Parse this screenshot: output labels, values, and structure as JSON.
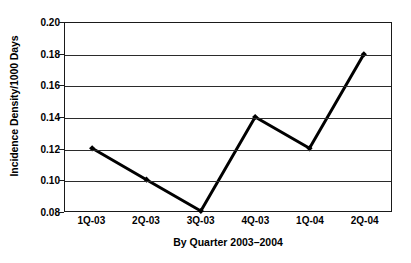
{
  "chart_data": {
    "type": "line",
    "title": "",
    "xlabel": "By Quarter 2003–2004",
    "ylabel": "Incidence Density/1000 Days",
    "categories": [
      "1Q-03",
      "2Q-03",
      "3Q-03",
      "4Q-03",
      "1Q-04",
      "2Q-04"
    ],
    "values": [
      0.12,
      0.1,
      0.08,
      0.14,
      0.12,
      0.18
    ],
    "ylim": [
      0.08,
      0.2
    ],
    "ytick_labels": [
      "0.20",
      "0.18",
      "0.16",
      "0.14",
      "0.12",
      "0.10",
      "0.08"
    ],
    "ytick_values": [
      0.2,
      0.18,
      0.16,
      0.14,
      0.12,
      0.1,
      0.08
    ],
    "ytick_step": 0.02,
    "grid": "horizontal",
    "legend": "none",
    "marker": "diamond",
    "line_color": "#000000",
    "marker_color": "#000000",
    "grid_color": "#2b2b2b",
    "frame_color": "#1a1a1a",
    "background_color": "#ffffff"
  }
}
